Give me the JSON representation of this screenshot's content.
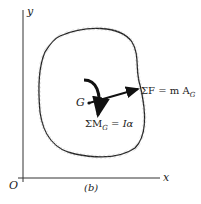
{
  "diagram": {
    "axes": {
      "x_label": "x",
      "y_label": "y",
      "origin_label": "O"
    },
    "center_label": "G",
    "force_label": {
      "prefix": "ΣF = m A",
      "sub": "G"
    },
    "moment_label": {
      "prefix": "ΣM",
      "sub": "G",
      "suffix": " = Iα"
    },
    "caption": "(b)"
  }
}
